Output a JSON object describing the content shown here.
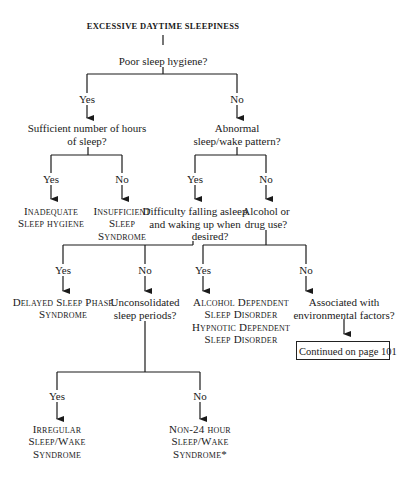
{
  "flowchart": {
    "title": "EXCESSIVE DAYTIME SLEEPINESS",
    "q_poor_hygiene": "Poor sleep hygiene?",
    "yes": "Yes",
    "no": "No",
    "q_sufficient_hours": [
      "Sufficient number of hours",
      "of sleep?"
    ],
    "q_abnormal_pattern": [
      "Abnormal",
      "sleep/wake pattern?"
    ],
    "dx_inadequate_hygiene": [
      "Inadequate",
      "Sleep hygiene"
    ],
    "dx_insufficient_sleep": [
      "Insufficient",
      "Sleep",
      "Syndrome"
    ],
    "q_difficulty": [
      "Difficulty falling asleep",
      "and waking up when",
      "desired?"
    ],
    "q_alcohol": [
      "Alcohol or",
      "drug use?"
    ],
    "dx_delayed_phase": [
      "Delayed Sleep Phase",
      "Syndrome"
    ],
    "q_unconsolidated": [
      "Unconsolidated",
      "sleep periods?"
    ],
    "dx_alcohol_hypnotic": [
      "Alcohol Dependent",
      "Sleep Disorder",
      "Hypnotic Dependent",
      "Sleep Disorder"
    ],
    "q_environmental": [
      "Associated with",
      "environmental factors?"
    ],
    "continued": "Continued on page 101",
    "dx_irregular": [
      "Irregular",
      "Sleep/Wake",
      "Syndrome"
    ],
    "dx_non24": [
      "Non-24 hour",
      "Sleep/Wake",
      "Syndrome*"
    ]
  },
  "colors": {
    "ink": "#1a1a1a",
    "background": "#ffffff"
  }
}
